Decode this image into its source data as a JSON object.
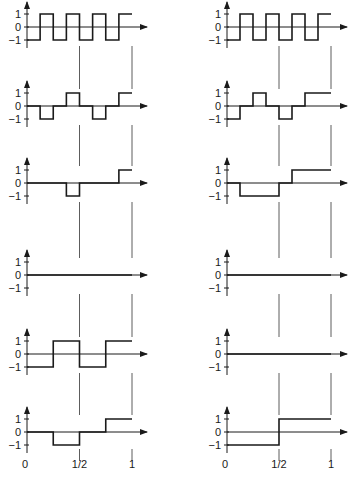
{
  "figure": {
    "y_ticks": [
      "1",
      "0",
      "−1"
    ],
    "x_tick_labels": [
      "0",
      "1/2",
      "1"
    ],
    "colors": {
      "ink": "#1a1a1a",
      "background": "#ffffff"
    }
  },
  "left_column": {
    "panels": [
      {
        "name": "square-wave-8",
        "levels": [
          [
            0,
            -1
          ],
          [
            0.125,
            1
          ],
          [
            0.25,
            -1
          ],
          [
            0.375,
            1
          ],
          [
            0.5,
            -1
          ],
          [
            0.625,
            1
          ],
          [
            0.75,
            -1
          ],
          [
            0.875,
            1
          ]
        ]
      },
      {
        "name": "sparse-pulses",
        "levels": [
          [
            0,
            0
          ],
          [
            0.125,
            -1
          ],
          [
            0.25,
            0
          ],
          [
            0.375,
            1
          ],
          [
            0.5,
            0
          ],
          [
            0.625,
            -1
          ],
          [
            0.75,
            0
          ],
          [
            0.875,
            1
          ]
        ]
      },
      {
        "name": "two-pulses",
        "levels": [
          [
            0,
            0
          ],
          [
            0.375,
            -1
          ],
          [
            0.5,
            0
          ],
          [
            0.875,
            1
          ]
        ]
      },
      {
        "name": "zero-line",
        "levels": [
          [
            0,
            0
          ]
        ]
      },
      {
        "name": "square-wave-4",
        "levels": [
          [
            0,
            -1
          ],
          [
            0.25,
            1
          ],
          [
            0.5,
            -1
          ],
          [
            0.75,
            1
          ]
        ]
      },
      {
        "name": "two-half-pulses",
        "levels": [
          [
            0,
            0
          ],
          [
            0.25,
            -1
          ],
          [
            0.5,
            0
          ],
          [
            0.75,
            1
          ]
        ]
      }
    ]
  },
  "right_column": {
    "panels": [
      {
        "name": "square-wave-8",
        "levels": [
          [
            0,
            -1
          ],
          [
            0.125,
            1
          ],
          [
            0.25,
            -1
          ],
          [
            0.375,
            1
          ],
          [
            0.5,
            -1
          ],
          [
            0.625,
            1
          ],
          [
            0.75,
            -1
          ],
          [
            0.875,
            1
          ]
        ]
      },
      {
        "name": "pulses",
        "levels": [
          [
            0,
            -1
          ],
          [
            0.125,
            0
          ],
          [
            0.25,
            1
          ],
          [
            0.375,
            0
          ],
          [
            0.5,
            -1
          ],
          [
            0.625,
            0
          ],
          [
            0.75,
            1
          ],
          [
            0.875,
            1
          ]
        ]
      },
      {
        "name": "step-segments",
        "levels": [
          [
            0,
            0
          ],
          [
            0.125,
            -1
          ],
          [
            0.5,
            0
          ],
          [
            0.625,
            1
          ]
        ]
      },
      {
        "name": "zero-line",
        "levels": [
          [
            0,
            0
          ]
        ]
      },
      {
        "name": "zero-line-2",
        "levels": [
          [
            0,
            0
          ]
        ]
      },
      {
        "name": "single-step",
        "levels": [
          [
            0,
            -1
          ],
          [
            0.5,
            1
          ]
        ]
      }
    ]
  }
}
